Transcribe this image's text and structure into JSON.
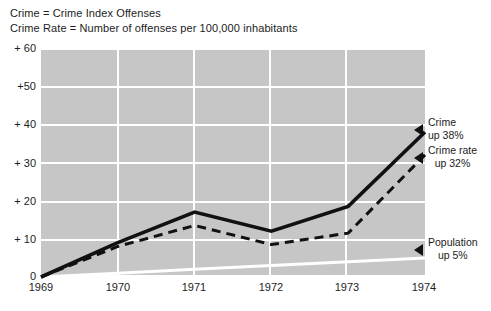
{
  "legend": {
    "lines": [
      "Crime = Crime Index Offenses",
      "Crime Rate = Number of offenses per 100,000 inhabitants"
    ]
  },
  "annotations": [
    {
      "name": "crime",
      "title": "Crime",
      "value": "up 38%"
    },
    {
      "name": "crime-rate",
      "title": "Crime rate",
      "value": "up 32%"
    },
    {
      "name": "population",
      "title": "Population",
      "value": "up 5%"
    }
  ],
  "colors": {
    "plot_background": "#c6c6c6",
    "gridline": "#ffffff",
    "crime_line": "#111111",
    "crime_rate_line": "#111111",
    "population_line": "#ffffff",
    "text": "#1c1c1c",
    "page_background": "#ffffff"
  },
  "chart_data": {
    "type": "line",
    "title": "",
    "subtitle": "",
    "xlabel": "",
    "ylabel": "",
    "x": [
      "1969",
      "1970",
      "1971",
      "1972",
      "1973",
      "1974"
    ],
    "xtick_labels": [
      "1969",
      "1970",
      "1971",
      "1972",
      "1973",
      "1974"
    ],
    "ytick_labels": [
      "0",
      "+ 10",
      "+ 20",
      "+ 30",
      "+ 40",
      "+50",
      "+ 60"
    ],
    "ytick_values": [
      0,
      10,
      20,
      30,
      40,
      50,
      60
    ],
    "ylim": [
      0,
      60
    ],
    "grid": true,
    "legend_position": "right-annotations",
    "series": [
      {
        "name": "Crime",
        "style": "solid",
        "color": "#111111",
        "end_label": "Crime up 38%",
        "values": [
          0,
          9,
          17,
          12,
          18.5,
          38
        ]
      },
      {
        "name": "Crime rate",
        "style": "dashed",
        "color": "#111111",
        "end_label": "Crime rate up 32%",
        "values": [
          0,
          8,
          13.5,
          8.5,
          11.5,
          32
        ]
      },
      {
        "name": "Population",
        "style": "solid-thin",
        "color": "#ffffff",
        "end_label": "Population up 5%",
        "values": [
          0,
          1,
          2,
          3,
          4,
          5
        ]
      }
    ]
  }
}
